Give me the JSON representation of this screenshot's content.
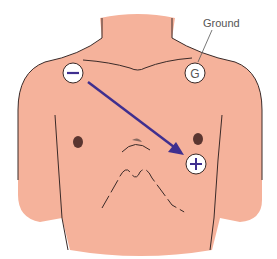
{
  "diagram": {
    "type": "ECG lead placement",
    "labels": {
      "ground": "Ground",
      "negative_electrode": "−",
      "positive_electrode": "+",
      "ground_electrode": "G"
    },
    "colors": {
      "skin": "#f5b29b",
      "outline": "#3a2a28",
      "arrow": "#3f2f8f",
      "electrode_fill": "#ffffff",
      "nipple": "#5a3530"
    }
  }
}
